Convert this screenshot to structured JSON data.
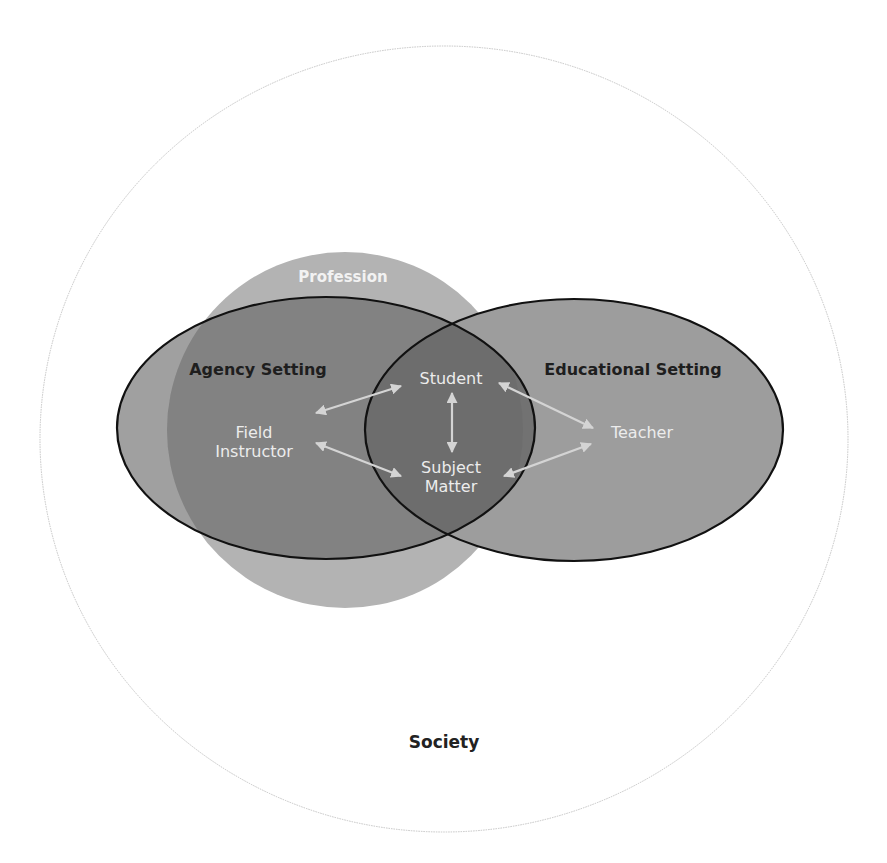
{
  "diagram": {
    "title": "Society",
    "regions": {
      "society": {
        "label": "Society"
      },
      "profession": {
        "label": "Profession"
      },
      "agency_setting": {
        "label": "Agency Setting"
      },
      "educational_setting": {
        "label": "Educational Setting"
      }
    },
    "nodes": {
      "field_instructor": {
        "line1": "Field",
        "line2": "Instructor"
      },
      "student": {
        "label": "Student"
      },
      "subject_matter": {
        "line1": "Subject",
        "line2": "Matter"
      },
      "teacher": {
        "label": "Teacher"
      }
    },
    "relationships": [
      {
        "from": "Field Instructor",
        "to": "Student",
        "type": "bidirectional"
      },
      {
        "from": "Field Instructor",
        "to": "Subject Matter",
        "type": "bidirectional"
      },
      {
        "from": "Student",
        "to": "Subject Matter",
        "type": "bidirectional"
      },
      {
        "from": "Student",
        "to": "Teacher",
        "type": "bidirectional"
      },
      {
        "from": "Subject Matter",
        "to": "Teacher",
        "type": "bidirectional"
      }
    ],
    "colors": {
      "society_stroke": "#c4c4c4",
      "profession_fill": "#b3b3b3",
      "agency_fill": "#7c7c7c",
      "educational_fill": "#9d9d9d",
      "overlap_fill": "#6c6c6c",
      "ellipse_stroke": "#111111",
      "arrow": "#d4d4d4"
    }
  }
}
